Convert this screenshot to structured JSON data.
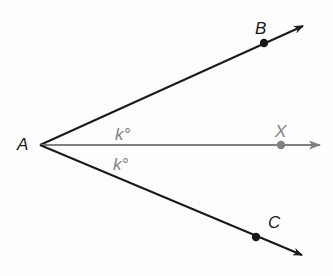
{
  "diagram": {
    "vertex": {
      "label": "A",
      "x": 40,
      "y": 145
    },
    "rays": [
      {
        "name": "ray-AB",
        "point_label": "B",
        "point": [
          264,
          43
        ],
        "tip": [
          303,
          26
        ],
        "label_pos": [
          255,
          34
        ],
        "color": "#1a1a1a"
      },
      {
        "name": "ray-AX",
        "point_label": "X",
        "point": [
          281,
          145
        ],
        "tip": [
          320,
          145
        ],
        "label_pos": [
          275,
          137
        ],
        "color": "#808080"
      },
      {
        "name": "ray-AC",
        "point_label": "C",
        "point": [
          256,
          237
        ],
        "tip": [
          302,
          255
        ],
        "label_pos": [
          268,
          228
        ],
        "color": "#1a1a1a"
      }
    ],
    "angle_labels": [
      {
        "text": "k°",
        "x": 115,
        "y": 140,
        "color": "#808080"
      },
      {
        "text": "k°",
        "x": 113,
        "y": 170,
        "color": "#808080"
      }
    ]
  }
}
